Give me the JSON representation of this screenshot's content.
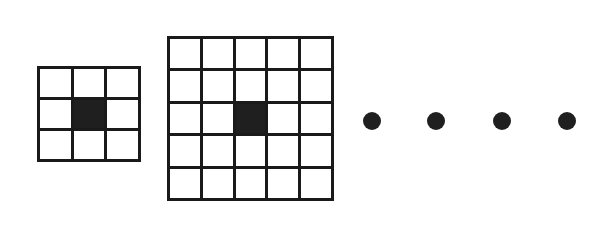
{
  "figure": {
    "background_color": "#ffffff",
    "line_color": "#1a1a1a",
    "fill_color": "#1f1f1f",
    "shapes": [
      {
        "name": "grid-3x3",
        "kind": "grid",
        "rows": 3,
        "cols": 3,
        "x": 37,
        "y": 66,
        "width": 104,
        "height": 96,
        "line_width": 3,
        "filled_cells": [
          [
            1,
            1
          ]
        ]
      },
      {
        "name": "grid-5x5",
        "kind": "grid",
        "rows": 5,
        "cols": 5,
        "x": 167,
        "y": 36,
        "width": 167,
        "height": 165,
        "line_width": 3,
        "filled_cells": [
          [
            2,
            2
          ]
        ]
      }
    ],
    "ellipsis": {
      "name": "ellipsis-dots",
      "count": 4,
      "radius": 9,
      "center_y": 121,
      "dot_centers_x": [
        372,
        436,
        502,
        567
      ]
    }
  }
}
